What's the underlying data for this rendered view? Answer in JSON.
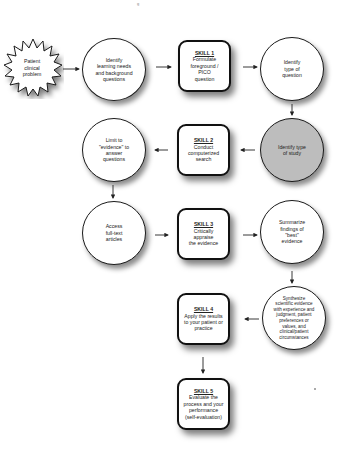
{
  "diagram": {
    "title_fragment": "g",
    "start": {
      "label": "Patient\nclinical\nproblem"
    },
    "nodes": {
      "identify_learning": {
        "label": "Identify\nlearning needs\nand background\nquestions"
      },
      "skill1": {
        "title": "SKILL 1",
        "label": "Formulate\nforeground / PICO\nquestion"
      },
      "identify_question": {
        "label": "Identify\ntype of\nquestion"
      },
      "identify_study": {
        "label": "Identify type\nof study"
      },
      "skill2": {
        "title": "SKILL 2",
        "label": "Conduct\ncomputerized\nsearch"
      },
      "limit_evidence": {
        "label": "Limit to\n\"evidence\" to\nanswer\nquestions"
      },
      "access_fulltext": {
        "label": "Access\nfull-text\narticles"
      },
      "skill3": {
        "title": "SKILL 3",
        "label": "Critically\nappraise\nthe evidence"
      },
      "summarize": {
        "label": "Summarize\nfindings of\n\"best\"\nevidence"
      },
      "synthesize": {
        "label": "Synthesize\nscientific evidence\nwith experience and\njudgment, patient\npreferences or\nvalues, and\nclinical/patient\ncircumstances"
      },
      "skill4": {
        "title": "SKILL 4",
        "label": "Apply the results\nto your patient or\npractice"
      },
      "skill5": {
        "title": "SKILL 5",
        "label": "Evaluate the\nprocess and your\nperformance\n(self-evaluation)"
      }
    },
    "colors": {
      "shaded_node": "#bdbdbd",
      "border": "#111111",
      "background": "#ffffff"
    }
  }
}
